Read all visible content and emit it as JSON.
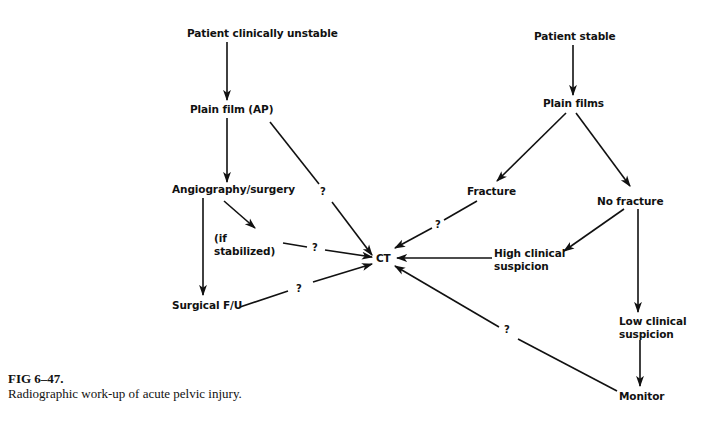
{
  "diagram": {
    "nodes": {
      "unstable": "Patient clinically unstable",
      "plain_film_ap": "Plain film (AP)",
      "angio": "Angiography/surgery",
      "if_stabilized": "(if\nstabilized)",
      "surgical_fu": "Surgical F/U",
      "ct": "CT",
      "stable": "Patient stable",
      "plain_films": "Plain films",
      "fracture": "Fracture",
      "no_fracture": "No fracture",
      "high_suspicion": "High clinical\nsuspicion",
      "low_suspicion": "Low clinical\nsuspicion",
      "monitor": "Monitor"
    },
    "question_mark": "?",
    "edges": [
      {
        "from": "unstable",
        "to": "plain_film_ap",
        "label": ""
      },
      {
        "from": "plain_film_ap",
        "to": "angio",
        "label": ""
      },
      {
        "from": "plain_film_ap",
        "to": "ct",
        "label": "?"
      },
      {
        "from": "angio",
        "to": "if_stabilized",
        "label": ""
      },
      {
        "from": "angio",
        "to": "surgical_fu",
        "label": ""
      },
      {
        "from": "if_stabilized",
        "to": "ct",
        "label": "?"
      },
      {
        "from": "surgical_fu",
        "to": "ct",
        "label": "?"
      },
      {
        "from": "stable",
        "to": "plain_films",
        "label": ""
      },
      {
        "from": "plain_films",
        "to": "fracture",
        "label": ""
      },
      {
        "from": "plain_films",
        "to": "no_fracture",
        "label": ""
      },
      {
        "from": "fracture",
        "to": "ct",
        "label": "?"
      },
      {
        "from": "no_fracture",
        "to": "high_suspicion",
        "label": ""
      },
      {
        "from": "no_fracture",
        "to": "low_suspicion",
        "label": ""
      },
      {
        "from": "high_suspicion",
        "to": "ct",
        "label": ""
      },
      {
        "from": "low_suspicion",
        "to": "monitor",
        "label": ""
      },
      {
        "from": "monitor",
        "to": "ct",
        "label": "?"
      }
    ]
  },
  "caption": {
    "figure_label": "FIG 6–47.",
    "text": "Radiographic work-up of acute pelvic injury."
  }
}
